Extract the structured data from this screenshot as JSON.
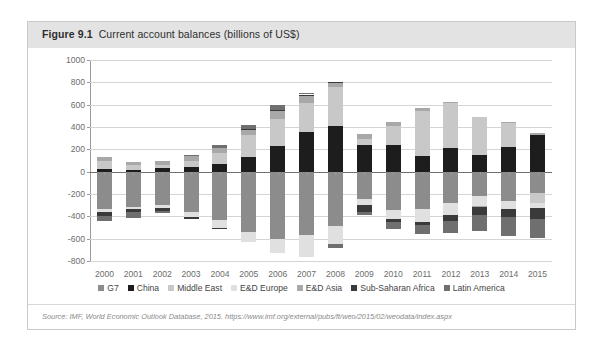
{
  "figure": {
    "number": "Figure 9.1",
    "caption": "Current account balances (billions of US$)",
    "source": "Source: IMF, World Economic Outlook Database, 2015. https://www.imf.org/external/pubs/ft/weo/2015/02/weodata/index.aspx"
  },
  "chart_data": {
    "type": "bar",
    "stacked": true,
    "title": "Current account balances (billions of US$)",
    "xlabel": "",
    "ylabel": "",
    "ylim": [
      -800,
      1000
    ],
    "yticks": [
      1000,
      800,
      600,
      400,
      200,
      0,
      -200,
      -400,
      -600,
      -800
    ],
    "ytick_labels": [
      "1000",
      "800",
      "600",
      "400",
      "200",
      "0",
      "-200",
      "-400",
      "-600",
      "-800"
    ],
    "grid": true,
    "legend_position": "bottom",
    "categories": [
      "2000",
      "2001",
      "2002",
      "2003",
      "2004",
      "2005",
      "2006",
      "2007",
      "2008",
      "2009",
      "2010",
      "2011",
      "2012",
      "2013",
      "2014",
      "2015"
    ],
    "series": [
      {
        "name": "G7",
        "color": "#8c8c8c",
        "values": [
          -330,
          -315,
          -300,
          -360,
          -430,
          -540,
          -600,
          -570,
          -490,
          -245,
          -340,
          -330,
          -285,
          -215,
          -260,
          -190
        ]
      },
      {
        "name": "China",
        "color": "#1d1d1d",
        "values": [
          20,
          17,
          35,
          46,
          69,
          132,
          232,
          353,
          412,
          243,
          238,
          136,
          215,
          148,
          220,
          331
        ]
      },
      {
        "name": "Middle East",
        "color": "#c8c8c8",
        "values": [
          72,
          42,
          22,
          48,
          98,
          196,
          242,
          260,
          344,
          50,
          173,
          410,
          400,
          340,
          215,
          -90
        ]
      },
      {
        "name": "E&D Europe",
        "color": "#e0e0e0",
        "values": [
          -28,
          -20,
          -28,
          -46,
          -72,
          -92,
          -130,
          -190,
          -160,
          -50,
          -85,
          -125,
          -100,
          -95,
          -70,
          -45
        ]
      },
      {
        "name": "E&D Asia",
        "color": "#a8a8a8",
        "values": [
          38,
          30,
          38,
          44,
          48,
          55,
          65,
          70,
          40,
          42,
          30,
          20,
          12,
          -10,
          12,
          18
        ]
      },
      {
        "name": "Sub-Saharan Africa",
        "color": "#3a3a3a",
        "values": [
          -38,
          -28,
          -22,
          -20,
          -12,
          2,
          12,
          8,
          8,
          -62,
          -30,
          -25,
          -55,
          -65,
          -75,
          -95
        ]
      },
      {
        "name": "Latin America",
        "color": "#6f6f6f",
        "values": [
          -48,
          -52,
          -16,
          8,
          20,
          35,
          48,
          12,
          -38,
          -30,
          -62,
          -78,
          -105,
          -150,
          -175,
          -170
        ]
      }
    ],
    "legend": [
      "G7",
      "China",
      "Middle East",
      "E&D Europe",
      "E&D Asia",
      "Sub-Saharan Africa",
      "Latin America"
    ]
  }
}
